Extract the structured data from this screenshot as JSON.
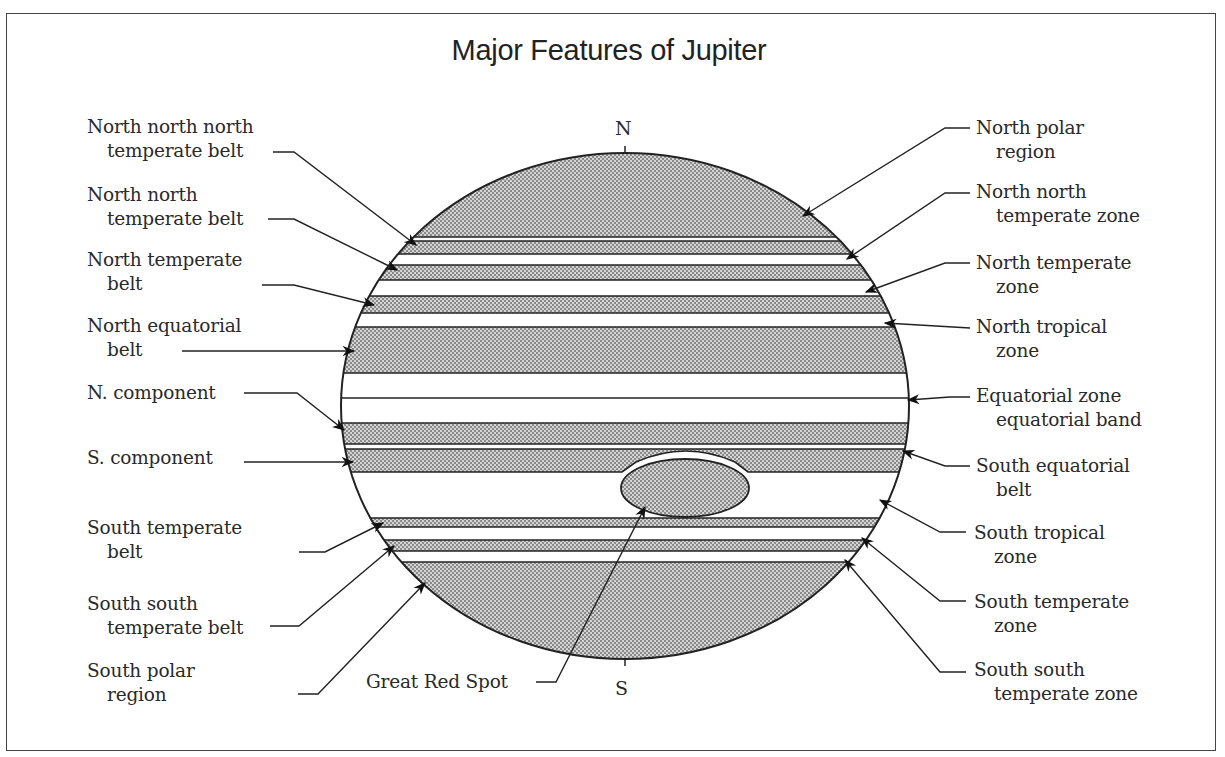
{
  "title": "Major Features of Jupiter",
  "poles": {
    "north": "N",
    "south": "S"
  },
  "colors": {
    "belt_fill": "#b8b8b8",
    "line": "#222222",
    "background": "#ffffff",
    "frame": "#444444"
  },
  "left_labels": [
    {
      "line1": "North north north",
      "line2": "temperate belt"
    },
    {
      "line1": "North north",
      "line2": "temperate belt"
    },
    {
      "line1": "North temperate",
      "line2": "belt"
    },
    {
      "line1": "North equatorial",
      "line2": "belt"
    },
    {
      "line1": "N. component",
      "line2": ""
    },
    {
      "line1": "S. component",
      "line2": ""
    },
    {
      "line1": "South temperate",
      "line2": "belt"
    },
    {
      "line1": "South south",
      "line2": "temperate belt"
    },
    {
      "line1": "South polar",
      "line2": "region"
    }
  ],
  "right_labels": [
    {
      "line1": "North polar",
      "line2": "region"
    },
    {
      "line1": "North north",
      "line2": "temperate zone"
    },
    {
      "line1": "North temperate",
      "line2": "zone"
    },
    {
      "line1": "North tropical",
      "line2": "zone"
    },
    {
      "line1": "Equatorial zone",
      "line2": "equatorial band"
    },
    {
      "line1": "South equatorial",
      "line2": "belt"
    },
    {
      "line1": "South tropical",
      "line2": "zone"
    },
    {
      "line1": "South temperate",
      "line2": "zone"
    },
    {
      "line1": "South south",
      "line2": "temperate zone"
    }
  ],
  "bottom_label": {
    "text": "Great Red Spot"
  }
}
